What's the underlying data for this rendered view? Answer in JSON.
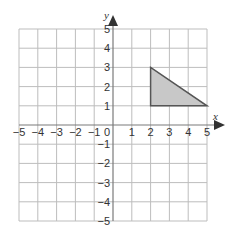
{
  "chart_data": {
    "type": "scatter",
    "title": "",
    "xlabel": "x",
    "ylabel": "y",
    "xlim": [
      -5,
      5
    ],
    "ylim": [
      -5,
      5
    ],
    "grid": true,
    "x_ticks": [
      "−5",
      "−4",
      "−3",
      "−2",
      "−1",
      "0",
      "1",
      "2",
      "3",
      "4",
      "5"
    ],
    "y_ticks": [
      "−5",
      "−4",
      "−3",
      "−2",
      "−1",
      "1",
      "2",
      "3",
      "4",
      "5"
    ],
    "shapes": [
      {
        "name": "triangle",
        "vertices": [
          [
            2,
            3
          ],
          [
            2,
            1
          ],
          [
            5,
            1
          ]
        ],
        "fill": "#c8c8c8",
        "stroke": "#555555"
      }
    ]
  },
  "colors": {
    "grid": "#bdbdbd",
    "axis": "#7a7a7a",
    "text": "#333333"
  }
}
